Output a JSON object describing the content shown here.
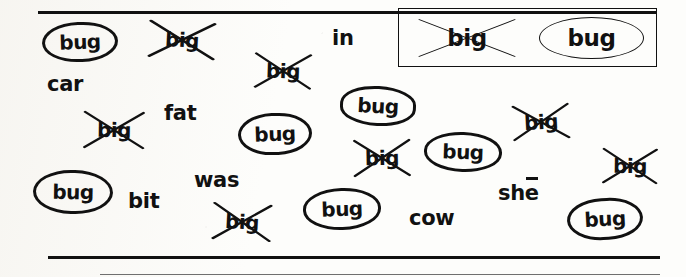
{
  "worksheet": {
    "title": "bug / big word discrimination worksheet",
    "ink_color": "#111111",
    "paper_color": "#fdfdfb",
    "legend": {
      "name": "key-box",
      "crossed_example": "big",
      "circled_example": "bug"
    },
    "rules": [
      {
        "name": "top-rule",
        "x": 38,
        "y": 11,
        "width": 618,
        "height": 3,
        "faint": false
      },
      {
        "name": "bottom-rule",
        "x": 48,
        "y": 256,
        "width": 612,
        "height": 3,
        "faint": false
      },
      {
        "name": "bottom-faint-rule",
        "x": 100,
        "y": 274,
        "width": 560,
        "height": 1,
        "faint": true
      }
    ],
    "tokens": [
      {
        "name": "circled-bug-1",
        "text": "bug",
        "kind": "circled",
        "x": 42,
        "y": 22,
        "w": 76,
        "h": 40
      },
      {
        "name": "crossed-big-1",
        "text": "big",
        "kind": "crossed",
        "x": 148,
        "y": 20,
        "w": 68,
        "h": 40
      },
      {
        "name": "word-car",
        "text": "car",
        "kind": "plain",
        "x": 47,
        "y": 74,
        "w": 46,
        "h": 24
      },
      {
        "name": "crossed-big-2",
        "text": "big",
        "kind": "crossed",
        "x": 254,
        "y": 52,
        "w": 58,
        "h": 38
      },
      {
        "name": "word-in",
        "text": "in",
        "kind": "plain",
        "x": 332,
        "y": 28,
        "w": 28,
        "h": 24
      },
      {
        "name": "crossed-big-3",
        "text": "big",
        "kind": "crossed",
        "x": 83,
        "y": 110,
        "w": 62,
        "h": 40
      },
      {
        "name": "word-fat",
        "text": "fat",
        "kind": "plain",
        "x": 164,
        "y": 103,
        "w": 44,
        "h": 24
      },
      {
        "name": "circled-bug-2",
        "text": "bug",
        "kind": "circled",
        "x": 238,
        "y": 113,
        "w": 74,
        "h": 42
      },
      {
        "name": "circled-bug-3",
        "text": "bug",
        "kind": "circled",
        "x": 340,
        "y": 86,
        "w": 76,
        "h": 40
      },
      {
        "name": "crossed-big-4",
        "text": "big",
        "kind": "crossed",
        "x": 353,
        "y": 138,
        "w": 58,
        "h": 40
      },
      {
        "name": "circled-bug-4",
        "text": "bug",
        "kind": "circled",
        "x": 424,
        "y": 132,
        "w": 78,
        "h": 40
      },
      {
        "name": "crossed-big-5",
        "text": "big",
        "kind": "crossed",
        "x": 512,
        "y": 103,
        "w": 58,
        "h": 38
      },
      {
        "name": "circled-bug-5",
        "text": "bug",
        "kind": "circled",
        "x": 33,
        "y": 170,
        "w": 80,
        "h": 44
      },
      {
        "name": "word-was",
        "text": "was",
        "kind": "plain",
        "x": 194,
        "y": 170,
        "w": 52,
        "h": 24
      },
      {
        "name": "word-bit",
        "text": "bit",
        "kind": "plain",
        "x": 128,
        "y": 191,
        "w": 38,
        "h": 24
      },
      {
        "name": "crossed-big-6",
        "text": "big",
        "kind": "crossed",
        "x": 212,
        "y": 202,
        "w": 60,
        "h": 40
      },
      {
        "name": "circled-bug-6",
        "text": "bug",
        "kind": "circled",
        "x": 303,
        "y": 188,
        "w": 78,
        "h": 42
      },
      {
        "name": "word-cow",
        "text": "cow",
        "kind": "plain",
        "x": 409,
        "y": 208,
        "w": 54,
        "h": 24
      },
      {
        "name": "crossed-big-7",
        "text": "big",
        "kind": "crossed",
        "x": 602,
        "y": 147,
        "w": 56,
        "h": 38
      },
      {
        "name": "circled-bug-7",
        "text": "bug",
        "kind": "circled",
        "x": 567,
        "y": 198,
        "w": 76,
        "h": 42
      }
    ],
    "she_word": {
      "name": "word-she",
      "prefix": "sh",
      "macron_letter": "e",
      "x": 498,
      "y": 183
    }
  }
}
